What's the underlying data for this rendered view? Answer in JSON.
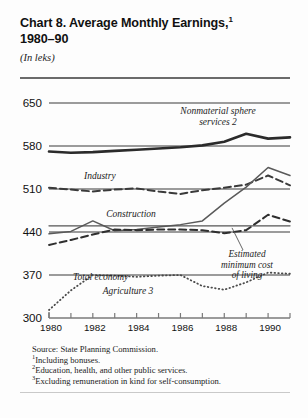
{
  "header": {
    "title_line1": "Chart 8. Average Monthly Earnings,",
    "title_sup": "1",
    "title_line2": "1980–90",
    "units": "(In leks)"
  },
  "notes": {
    "source": "Source:  State Planning Commission.",
    "note1_marker": "1",
    "note1": "Including bonuses.",
    "note2_marker": "2",
    "note2": "Education, health, and other public services.",
    "note3_marker": "3",
    "note3": "Excluding remuneration in kind for self-consumption."
  },
  "chart_data": {
    "type": "line",
    "subtitle": "(In leks)",
    "xlabel": "",
    "ylabel": "",
    "units": "leks",
    "grid": true,
    "legend_position": "inline-annotations",
    "xlim": [
      1980,
      1991
    ],
    "ylim": [
      300,
      650
    ],
    "yticks": [
      300,
      370,
      440,
      510,
      580,
      650
    ],
    "ytick_labels": [
      "300",
      "370",
      "440",
      "510",
      "580",
      "650"
    ],
    "xticks": [
      1980,
      1981,
      1982,
      1983,
      1984,
      1985,
      1986,
      1987,
      1988,
      1989,
      1990,
      1991
    ],
    "xtick_labels": [
      "1980",
      "",
      "1982",
      "",
      "1984",
      "",
      "1986",
      "",
      "1988",
      "",
      "1990",
      ""
    ],
    "x": [
      1980,
      1981,
      1982,
      1983,
      1984,
      1985,
      1986,
      1987,
      1988,
      1989,
      1990,
      1991
    ],
    "series": [
      {
        "name": "Nonmaterial sphere services",
        "label": "Nonmaterial sphere",
        "label2": "services",
        "marker": "2",
        "style": "solid-thick",
        "color": "#2b2b2b",
        "width": 2.6,
        "values": [
          571,
          569,
          570,
          572,
          574,
          576,
          578,
          581,
          587,
          600,
          592,
          594
        ]
      },
      {
        "name": "Industry",
        "label": "Industry",
        "marker": "",
        "style": "dashed",
        "color": "#3a3a3a",
        "width": 2.0,
        "values": [
          512,
          509,
          506,
          509,
          511,
          506,
          502,
          508,
          512,
          517,
          532,
          516
        ]
      },
      {
        "name": "Construction",
        "label": "Construction",
        "marker": "",
        "style": "solid-thin",
        "color": "#5a5a5a",
        "width": 1.5,
        "values": [
          437,
          441,
          458,
          442,
          444,
          448,
          452,
          458,
          487,
          513,
          545,
          532
        ]
      },
      {
        "name": "Total economy",
        "label": "Total economy",
        "marker": "",
        "style": "dashed",
        "color": "#2f2f2f",
        "width": 2.0,
        "values": [
          419,
          427,
          436,
          444,
          443,
          444,
          444,
          443,
          438,
          443,
          468,
          457
        ]
      },
      {
        "name": "Estimated minimum cost of living",
        "label": "Estimated",
        "label2": "minimum cost",
        "label3": "of living",
        "marker": "",
        "style": "solid-thin",
        "color": "#555555",
        "width": 1.4,
        "values": [
          450,
          450,
          450,
          450,
          450,
          450,
          450,
          450,
          450,
          450,
          450,
          450
        ]
      },
      {
        "name": "Agriculture",
        "label": "Agriculture",
        "marker": "3",
        "style": "dotted",
        "color": "#4a4a4a",
        "width": 1.8,
        "values": [
          313,
          345,
          370,
          369,
          367,
          369,
          370,
          352,
          346,
          358,
          374,
          372
        ]
      }
    ]
  }
}
